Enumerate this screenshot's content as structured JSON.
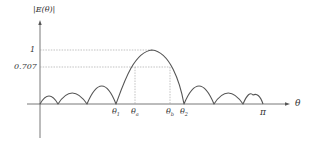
{
  "diagram": {
    "type": "radiation-pattern",
    "y_axis_label": "|E(θ)|",
    "x_axis_label": "θ",
    "y_levels": [
      {
        "label": "1",
        "value": 1.0
      },
      {
        "label": "0.707",
        "value": 0.707
      }
    ],
    "x_markers": [
      {
        "symbol": "θ",
        "sub": "1",
        "role": "first null left of main lobe"
      },
      {
        "symbol": "θ",
        "sub": "a",
        "role": "half-power point (left)"
      },
      {
        "symbol": "θ",
        "sub": "b",
        "role": "half-power point (right)"
      },
      {
        "symbol": "θ",
        "sub": "2",
        "role": "first null right of main lobe"
      },
      {
        "symbol": "π",
        "sub": "",
        "role": "end of range"
      }
    ],
    "colors": {
      "curve": "#555555",
      "axes": "#555555",
      "guides": "#999999",
      "text": "#333333"
    }
  },
  "labels": {
    "y_axis": "|E(θ)|",
    "x_axis": "θ",
    "level_1": "1",
    "level_0707": "0.707",
    "theta": "θ",
    "sub_1": "1",
    "sub_a": "a",
    "sub_b": "b",
    "sub_2": "2",
    "pi": "π"
  }
}
